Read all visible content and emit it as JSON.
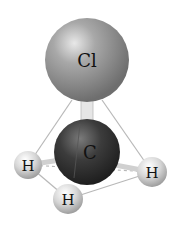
{
  "molecule": {
    "name": "chloromethane",
    "atoms": [
      {
        "id": "cl",
        "label": "Cl",
        "cx": 87,
        "cy": 60,
        "r": 42,
        "color": "#9a9a9a"
      },
      {
        "id": "c",
        "label": "C",
        "cx": 87,
        "cy": 152,
        "r": 33,
        "color": "#3a3a3a"
      },
      {
        "id": "h1",
        "label": "H",
        "cx": 28,
        "cy": 165,
        "r": 14,
        "color": "#d8d8d8"
      },
      {
        "id": "h2",
        "label": "H",
        "cx": 68,
        "cy": 199,
        "r": 15,
        "color": "#d8d8d8"
      },
      {
        "id": "h3",
        "label": "H",
        "cx": 152,
        "cy": 172,
        "r": 15,
        "color": "#d8d8d8"
      }
    ]
  },
  "labels": {
    "cl": "Cl",
    "c": "C",
    "h1": "H",
    "h2": "H",
    "h3": "H"
  }
}
